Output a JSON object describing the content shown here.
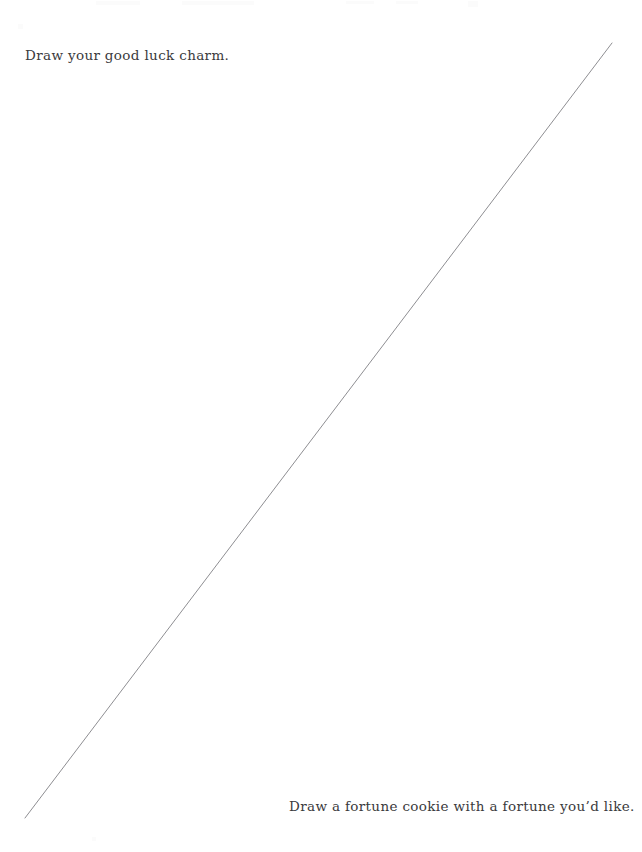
{
  "page": {
    "background_color": "#ffffff",
    "width": 642,
    "height": 852
  },
  "prompts": {
    "top": "Draw your good luck charm.",
    "bottom": "Draw a fortune cookie with a fortune you’d like."
  },
  "drawing": {
    "name": "diagonal-pencil-line",
    "stroke_color": "#8e8e92",
    "stroke_width": 1,
    "x1": 25,
    "y1": 818,
    "x2": 612,
    "y2": 43
  },
  "text_style": {
    "color": "#3a3a3c"
  }
}
